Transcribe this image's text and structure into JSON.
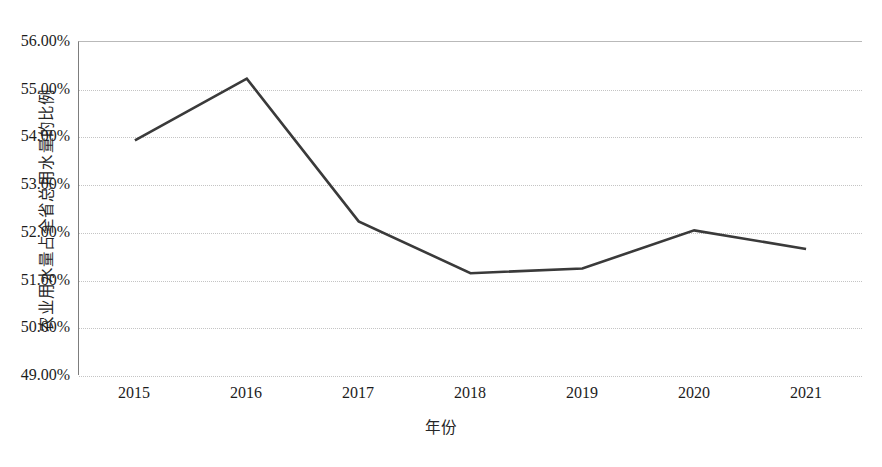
{
  "chart_data": {
    "type": "line",
    "title": "",
    "xlabel": "年份",
    "ylabel": "农业用水量占全省总用水量的比例",
    "x": [
      2015,
      2016,
      2017,
      2018,
      2019,
      2020,
      2021
    ],
    "categories": [
      "2015",
      "2016",
      "2017",
      "2018",
      "2019",
      "2020",
      "2021"
    ],
    "values": [
      53.93,
      55.23,
      52.23,
      51.14,
      51.24,
      52.04,
      51.65
    ],
    "series": [
      {
        "name": "农业用水量占全省总用水量的比例",
        "values": [
          53.93,
          55.23,
          52.23,
          51.14,
          51.24,
          52.04,
          51.65
        ]
      }
    ],
    "ylim": [
      49.0,
      56.0
    ],
    "ytick_values": [
      49.0,
      50.0,
      51.0,
      52.0,
      53.0,
      54.0,
      55.0,
      56.0
    ],
    "ytick_labels": [
      "49.00%",
      "50.00%",
      "51.00%",
      "52.00%",
      "53.00%",
      "54.00%",
      "55.00%",
      "56.00%"
    ],
    "xtick_labels": [
      "2015",
      "2016",
      "2017",
      "2018",
      "2019",
      "2020",
      "2021"
    ],
    "grid": true,
    "grid_axis": "y",
    "legend": false,
    "legend_position": "none",
    "line_color": "#3a3a3a",
    "line_width": 2.6,
    "markers": false,
    "annotations": [],
    "plot_background": "#ffffff",
    "gridline_color": "#c4c4c4",
    "axis_color": "#7d7d7d",
    "text_color": "#1c1c1c"
  }
}
